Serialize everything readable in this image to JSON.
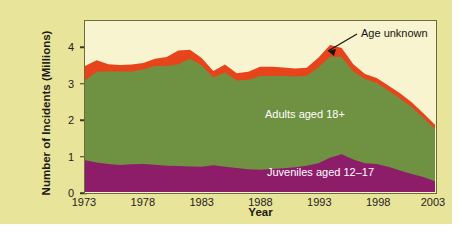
{
  "figure": {
    "background_color": "#e8e49a",
    "plot_background_color": "#f7f4cf",
    "frame_color": "#6f6a3a"
  },
  "axes": {
    "ylabel": "Number of Incidents (Millions)",
    "xlabel": "Year",
    "yticks": [
      "0",
      "1",
      "2",
      "3",
      "4"
    ],
    "xticks": [
      "1973",
      "1978",
      "1983",
      "1988",
      "1993",
      "1998",
      "2003"
    ]
  },
  "annotations": {
    "age_unknown": "Age unknown",
    "adults": "Adults aged 18+",
    "juveniles": "Juveniles aged 12–17"
  },
  "colors": {
    "juveniles": "#8e1d69",
    "adults": "#6f9142",
    "age_unknown": "#e8441c"
  },
  "chart_data": {
    "type": "area",
    "stacked": true,
    "title": "",
    "xlabel": "Year",
    "ylabel": "Number of Incidents (Millions)",
    "xlim": [
      1973,
      2003
    ],
    "ylim": [
      0,
      4.75
    ],
    "grid": false,
    "legend": "inline-labels",
    "x": [
      1973,
      1974,
      1975,
      1976,
      1977,
      1978,
      1979,
      1980,
      1981,
      1982,
      1983,
      1984,
      1985,
      1986,
      1987,
      1988,
      1989,
      1990,
      1991,
      1992,
      1993,
      1994,
      1995,
      1996,
      1997,
      1998,
      1999,
      2000,
      2001,
      2002,
      2003
    ],
    "series": [
      {
        "name": "Juveniles aged 12-17",
        "color": "#8e1d69",
        "values": [
          0.88,
          0.82,
          0.78,
          0.75,
          0.77,
          0.78,
          0.76,
          0.73,
          0.72,
          0.71,
          0.7,
          0.74,
          0.7,
          0.67,
          0.63,
          0.62,
          0.64,
          0.66,
          0.69,
          0.73,
          0.8,
          0.95,
          1.05,
          0.9,
          0.8,
          0.78,
          0.7,
          0.6,
          0.5,
          0.42,
          0.3
        ]
      },
      {
        "name": "Adults aged 18+",
        "color": "#6f9142",
        "values": [
          2.22,
          2.52,
          2.57,
          2.6,
          2.58,
          2.62,
          2.74,
          2.77,
          2.83,
          2.99,
          2.82,
          2.44,
          2.62,
          2.43,
          2.49,
          2.6,
          2.58,
          2.57,
          2.52,
          2.5,
          2.66,
          2.81,
          2.7,
          2.45,
          2.34,
          2.25,
          2.12,
          2.0,
          1.86,
          1.64,
          1.45
        ]
      },
      {
        "name": "Age unknown",
        "color": "#e8441c",
        "values": [
          0.4,
          0.32,
          0.2,
          0.18,
          0.19,
          0.18,
          0.2,
          0.25,
          0.38,
          0.25,
          0.2,
          0.18,
          0.22,
          0.2,
          0.22,
          0.26,
          0.26,
          0.23,
          0.22,
          0.22,
          0.27,
          0.32,
          0.25,
          0.2,
          0.14,
          0.14,
          0.14,
          0.14,
          0.13,
          0.13,
          0.12
        ]
      }
    ],
    "totals": [
      3.5,
      3.66,
      3.55,
      3.53,
      3.54,
      3.58,
      3.7,
      3.75,
      3.93,
      3.95,
      3.72,
      3.36,
      3.54,
      3.3,
      3.34,
      3.48,
      3.48,
      3.46,
      3.43,
      3.45,
      3.73,
      4.08,
      4.0,
      3.55,
      3.28,
      3.17,
      2.96,
      2.74,
      2.49,
      2.19,
      1.87
    ]
  }
}
